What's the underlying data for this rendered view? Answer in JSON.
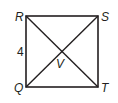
{
  "diagram": {
    "type": "square-with-diagonals",
    "vertices": {
      "R": {
        "label": "R",
        "x": 26,
        "y": 16
      },
      "S": {
        "label": "S",
        "x": 98,
        "y": 16
      },
      "T": {
        "label": "T",
        "x": 98,
        "y": 87
      },
      "Q": {
        "label": "Q",
        "x": 26,
        "y": 87
      }
    },
    "intersection": {
      "label": "V"
    },
    "side_label": {
      "text": "4",
      "side": "RQ"
    },
    "stroke_color": "#231f20"
  }
}
